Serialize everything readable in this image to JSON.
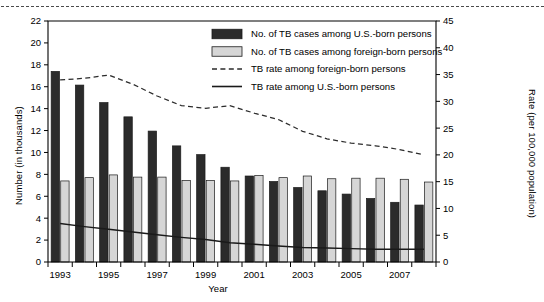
{
  "chart_data": {
    "type": "bar",
    "title": "",
    "xlabel": "Year",
    "ylabel": "Number (in thousands)",
    "y2label": "Rate (per 100,000 population)",
    "ylim": [
      0,
      22
    ],
    "y2lim": [
      0,
      45
    ],
    "yticks": [
      0,
      2,
      4,
      6,
      8,
      10,
      12,
      14,
      16,
      18,
      20,
      22
    ],
    "y2ticks": [
      0,
      5,
      10,
      15,
      20,
      25,
      30,
      35,
      40,
      45
    ],
    "xticks_labeled": [
      "1993",
      "1995",
      "1997",
      "1999",
      "2001",
      "2003",
      "2005",
      "2007"
    ],
    "categories": [
      1993,
      1994,
      1995,
      1996,
      1997,
      1998,
      1999,
      2000,
      2001,
      2002,
      2003,
      2004,
      2005,
      2006,
      2007,
      2008
    ],
    "grid": false,
    "legend_position": "upper-right",
    "series": [
      {
        "name": "No. of TB cases among U.S.-born persons",
        "kind": "bar",
        "axis": "left",
        "color": "#2b2b2b",
        "values": [
          17.4,
          16.15,
          14.55,
          13.25,
          11.95,
          10.6,
          9.8,
          8.65,
          7.85,
          7.35,
          6.8,
          6.5,
          6.2,
          5.8,
          5.45,
          5.2
        ]
      },
      {
        "name": "No. of TB cases among foreign-born persons",
        "kind": "bar",
        "axis": "left",
        "color": "#d6d6d6",
        "values": [
          7.4,
          7.7,
          7.95,
          7.75,
          7.75,
          7.45,
          7.45,
          7.4,
          7.9,
          7.7,
          7.85,
          7.6,
          7.65,
          7.65,
          7.55,
          7.3
        ]
      },
      {
        "name": "TB rate among foreign-born persons",
        "kind": "line",
        "style": "dashed",
        "axis": "right",
        "color": "#2b2b2b",
        "values": [
          34.0,
          34.3,
          34.9,
          33.2,
          31.0,
          29.2,
          28.7,
          29.2,
          27.8,
          26.6,
          24.4,
          23.0,
          22.2,
          21.7,
          21.0,
          20.0
        ]
      },
      {
        "name": "TB rate among U.S.-born persons",
        "kind": "line",
        "style": "solid",
        "axis": "right",
        "color": "#1a1a1a",
        "values": [
          7.2,
          6.6,
          6.1,
          5.6,
          5.1,
          4.6,
          4.2,
          3.6,
          3.3,
          3.0,
          2.7,
          2.6,
          2.5,
          2.4,
          2.4,
          2.4
        ]
      }
    ]
  },
  "legend": {
    "items": [
      {
        "label": "No. of TB cases among U.S.-born persons",
        "swatch": "dark-bar-swatch"
      },
      {
        "label": "No. of TB cases among foreign-born persons",
        "swatch": "light-bar-swatch"
      },
      {
        "label": "TB rate among foreign-born persons",
        "swatch": "dashed-line-swatch"
      },
      {
        "label": "TB rate among U.S.-born persons",
        "swatch": "solid-line-swatch"
      }
    ]
  }
}
